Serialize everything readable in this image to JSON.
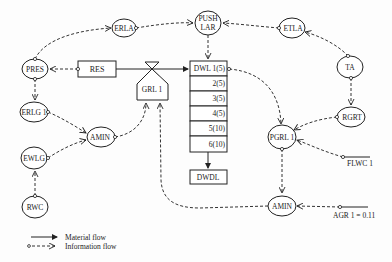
{
  "diagram": {
    "type": "system-dynamics-flow-diagram",
    "nodes": {
      "erla": {
        "label": "ERLA"
      },
      "push_lar": {
        "line1": "PUSH",
        "line2": "LAR"
      },
      "etla": {
        "label": "ETLA"
      },
      "pres": {
        "label": "PRES"
      },
      "res": {
        "label": "RES"
      },
      "grl1": {
        "label": "GRL 1"
      },
      "dwl_stack": {
        "rows": [
          "DWL 1(5)",
          "2(5)",
          "3(5)",
          "4(5)",
          "5(10)",
          "6(10)"
        ]
      },
      "dwdl": {
        "label": "DWDL"
      },
      "ta": {
        "label": "TA"
      },
      "rgrt": {
        "label": "RGRT"
      },
      "erlg1": {
        "label": "ERLG 1"
      },
      "amin_left": {
        "label": "AMIN"
      },
      "pgrl1": {
        "label": "PGRL 1"
      },
      "flwc1": {
        "label": "FLWC 1"
      },
      "ewlg": {
        "label": "EWLG"
      },
      "rwc": {
        "label": "RWC"
      },
      "amin_bottom": {
        "label": "AMIN"
      },
      "agr1": {
        "label": "AGR 1 = 0.11"
      }
    },
    "legend": {
      "material": "Material flow",
      "information": "Information flow"
    },
    "colors": {
      "ink": "#222222",
      "background": "#fdfdfd"
    }
  }
}
